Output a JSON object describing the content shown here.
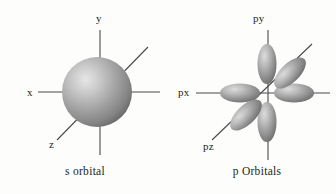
{
  "figure": {
    "background_color": "#fdfdfc",
    "ink_color": "#231f20",
    "axis_color": "#4a4a4a",
    "orbital_fill_light": "#d8d8d8",
    "orbital_fill_dark": "#5d5d5d"
  },
  "panels": [
    {
      "id": "s-orbital",
      "caption": "s orbital",
      "shape": "sphere",
      "axis_labels": [
        {
          "key": "y",
          "label": "y",
          "direction": "up"
        },
        {
          "key": "x",
          "label": "x",
          "direction": "left"
        },
        {
          "key": "z",
          "label": "z",
          "direction": "lower-left"
        }
      ]
    },
    {
      "id": "p-orbitals",
      "caption": "p Orbitals",
      "shape": "six-lobes",
      "lobe_count": 6,
      "axis_labels": [
        {
          "key": "py",
          "label": "py",
          "direction": "up"
        },
        {
          "key": "px",
          "label": "px",
          "direction": "left"
        },
        {
          "key": "pz",
          "label": "pz",
          "direction": "lower-left"
        }
      ]
    }
  ]
}
